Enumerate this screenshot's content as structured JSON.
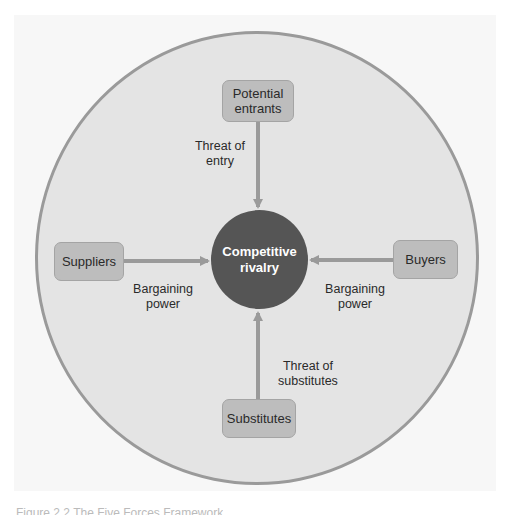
{
  "diagram": {
    "center": {
      "label_line1": "Competitive",
      "label_line2": "rivalry"
    },
    "forces": {
      "top": {
        "box_line1": "Potential",
        "box_line2": "entrants",
        "arrow_label_line1": "Threat of",
        "arrow_label_line2": "entry"
      },
      "left": {
        "box_label": "Suppliers",
        "arrow_label_line1": "Bargaining",
        "arrow_label_line2": "power"
      },
      "right": {
        "box_label": "Buyers",
        "arrow_label_line1": "Bargaining",
        "arrow_label_line2": "power"
      },
      "bottom": {
        "box_label": "Substitutes",
        "arrow_label_line1": "Threat of",
        "arrow_label_line2": "substitutes"
      }
    },
    "colors": {
      "outer_circle_fill": "#e4e4e4",
      "outer_circle_stroke": "#9a9a9a",
      "center_fill": "#555555",
      "box_fill": "#bdbdbd",
      "arrow": "#9a9a9a"
    }
  },
  "caption": "Figure 2.2 The Five Forces Framework"
}
